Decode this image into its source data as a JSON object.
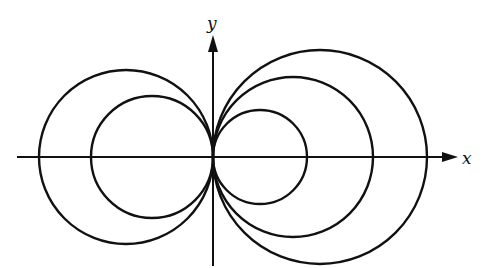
{
  "diagram": {
    "axes": {
      "x_label": "x",
      "y_label": "y",
      "origin": [
        213,
        157
      ],
      "x_axis": {
        "start": 17,
        "end": 458
      },
      "y_axis": {
        "start": 266,
        "end": 35
      }
    },
    "circles": [
      {
        "side": "left",
        "cx": 126,
        "cy": 157,
        "r": 87
      },
      {
        "side": "left",
        "cx": 152,
        "cy": 157,
        "r": 61
      },
      {
        "side": "right",
        "cx": 260,
        "cy": 157,
        "r": 47
      },
      {
        "side": "right",
        "cx": 293,
        "cy": 157,
        "r": 80
      },
      {
        "side": "right",
        "cx": 320,
        "cy": 157,
        "r": 107
      }
    ],
    "colors": {
      "stroke": "#111111",
      "background": "#ffffff"
    }
  }
}
